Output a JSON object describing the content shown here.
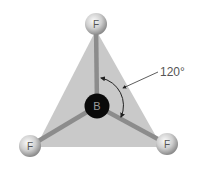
{
  "diagram": {
    "molecule": "BF3",
    "central_atom": {
      "symbol": "B",
      "color": "#0a0a0a",
      "text_color": "#9a9a9a"
    },
    "outer_atoms": [
      {
        "symbol": "F",
        "position": "top"
      },
      {
        "symbol": "F",
        "position": "bottom-left"
      },
      {
        "symbol": "F",
        "position": "bottom-right"
      }
    ],
    "angle_label": "120°",
    "colors": {
      "triangle": "#c9c9c9",
      "bond": "#8c8c8c",
      "atom_light": "#f2f2f2",
      "atom_dark": "#8a8a8a",
      "arrow": "#333333"
    }
  }
}
